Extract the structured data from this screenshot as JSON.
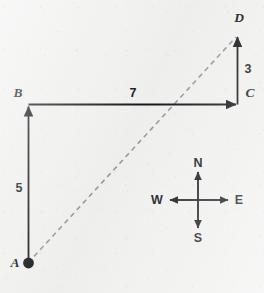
{
  "figure": {
    "background_color": "#f2f2f1",
    "stroke_color": "#15171a",
    "dashed_color": "#9a9a9a"
  },
  "points": [
    {
      "id": "A",
      "label": "A",
      "x": 28,
      "y": 263,
      "label_x": 15,
      "label_y": 263,
      "marker": "filled-dot"
    },
    {
      "id": "B",
      "label": "B",
      "x": 29,
      "y": 104,
      "label_x": 18,
      "label_y": 93,
      "marker": "none"
    },
    {
      "id": "C",
      "label": "C",
      "x": 238,
      "y": 104,
      "label_x": 250,
      "label_y": 93,
      "marker": "none"
    },
    {
      "id": "D",
      "label": "D",
      "x": 238,
      "y": 34,
      "label_x": 239,
      "label_y": 18,
      "marker": "none"
    }
  ],
  "segments": [
    {
      "id": "AB",
      "from": "A",
      "to": "B",
      "style": "solid",
      "arrow": "end",
      "length_label": "5",
      "label_x": 19,
      "label_y": 188
    },
    {
      "id": "BC",
      "from": "B",
      "to": "C",
      "style": "solid",
      "arrow": "end",
      "length_label": "7",
      "label_x": 133,
      "label_y": 93
    },
    {
      "id": "CD",
      "from": "C",
      "to": "D",
      "style": "solid",
      "arrow": "end",
      "length_label": "3",
      "label_x": 248,
      "label_y": 69
    },
    {
      "id": "AD",
      "from": "A",
      "to": "D",
      "style": "dashed",
      "arrow": "none",
      "length_label": "",
      "label_x": 0,
      "label_y": 0
    }
  ],
  "compass": {
    "center_x": 198,
    "center_y": 200,
    "arm": 28,
    "directions": [
      {
        "id": "north",
        "label": "N",
        "label_x": 198,
        "label_y": 163
      },
      {
        "id": "east",
        "label": "E",
        "label_x": 239,
        "label_y": 200
      },
      {
        "id": "south",
        "label": "S",
        "label_x": 198,
        "label_y": 238
      },
      {
        "id": "west",
        "label": "W",
        "label_x": 157,
        "label_y": 200
      }
    ]
  }
}
